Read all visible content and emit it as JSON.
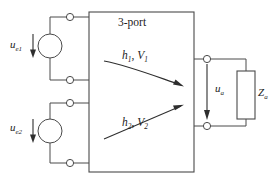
{
  "diagram": {
    "block": {
      "label": "3-port",
      "internal_paths": [
        {
          "label": "h",
          "sub": "1",
          "label2": "V",
          "sub2": "1",
          "text": "h₁, V₁",
          "direction": "down-right"
        },
        {
          "label": "h",
          "sub": "2",
          "label2": "V",
          "sub2": "2",
          "text": "h₂, V₂",
          "direction": "up-right"
        }
      ]
    },
    "sources": [
      {
        "name": "source-1",
        "label_base": "u",
        "label_sub": "e1",
        "text": "uₑ₁",
        "arrow": "down"
      },
      {
        "name": "source-2",
        "label_base": "u",
        "label_sub": "e2",
        "text": "uₑ₂",
        "arrow": "down"
      }
    ],
    "output": {
      "voltage": {
        "label_base": "u",
        "label_sub": "a",
        "text": "uₐ",
        "arrow": "down"
      },
      "load": {
        "label_base": "Z",
        "label_sub": "a",
        "text": "Zₐ"
      }
    },
    "colors": {
      "line": "#4a4a4a",
      "arrow": "#2e2e2e",
      "text": "#1c1c1c",
      "background": "#ffffff"
    }
  },
  "labels": {
    "three_port": "3-port",
    "h1v1_main": "h",
    "h1v1_sub": "1",
    "h1v1_main2": "V",
    "h1v1_sub2": "1",
    "h2v2_main": "h",
    "h2v2_sub": "2",
    "h2v2_main2": "V",
    "h2v2_sub2": "2",
    "ue1_main": "u",
    "ue1_sub": "e1",
    "ue2_main": "u",
    "ue2_sub": "e2",
    "ua_main": "u",
    "ua_sub": "a",
    "za_main": "Z",
    "za_sub": "a"
  }
}
